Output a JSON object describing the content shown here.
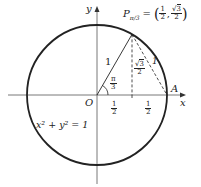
{
  "diagram": {
    "type": "unit-circle",
    "colors": {
      "stroke": "#222222",
      "axis": "#555555",
      "background": "#ffffff"
    },
    "axes": {
      "x_label": "x",
      "y_label": "y",
      "origin_label": "O"
    },
    "circle": {
      "equation": "x² + y² = 1"
    },
    "point_P": {
      "name": "P",
      "subscript": "π/3",
      "equals": "=",
      "x_num": "1",
      "x_den": "2",
      "y_num_root": "3",
      "y_den": "2"
    },
    "point_A": {
      "name": "A"
    },
    "radius_label": "1",
    "chord_label": "1",
    "angle": {
      "num": "π",
      "den": "3"
    },
    "height": {
      "num_root": "3",
      "den": "2"
    },
    "segment_1": {
      "num": "1",
      "den": "2"
    },
    "segment_2": {
      "num": "1",
      "den": "2"
    }
  }
}
